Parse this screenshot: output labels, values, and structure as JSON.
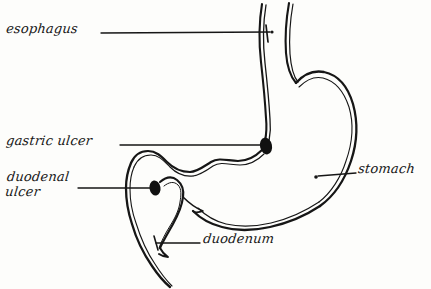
{
  "figure": {
    "kind": "hand-drawn anatomical line diagram",
    "background_color": "#fdfdfb",
    "ink_color": "#161616"
  },
  "labels": {
    "esophagus": "esophagus",
    "gastric_ulcer": "gastric ulcer",
    "duodenal_ulcer_line1": "duodenal",
    "duodenal_ulcer_line2": "ulcer",
    "duodenum": "duodenum",
    "stomach": "stomach"
  },
  "markers": [
    {
      "name": "gastric-ulcer-marker",
      "shape": "filled-oval",
      "color": "#111111",
      "cx": 266,
      "cy": 146,
      "rx": 6,
      "ry": 8
    },
    {
      "name": "duodenal-ulcer-marker",
      "shape": "filled-oval",
      "color": "#111111",
      "cx": 155,
      "cy": 188,
      "rx": 5.5,
      "ry": 7.5
    }
  ],
  "leader_lines": [
    {
      "name": "esophagus-leader",
      "from_x": 101,
      "from_y": 33,
      "to_x": 271,
      "to_y": 32,
      "end_marker": "cross-tick"
    },
    {
      "name": "gastric-ulcer-leader",
      "from_x": 120,
      "from_y": 145,
      "to_x": 261,
      "to_y": 145,
      "end_marker": "ulcer-oval"
    },
    {
      "name": "duodenal-ulcer-leader",
      "from_x": 78,
      "from_y": 188,
      "to_x": 150,
      "to_y": 188,
      "end_marker": "ulcer-oval"
    },
    {
      "name": "duodenum-leader",
      "from_x": 200,
      "from_y": 243,
      "to_x": 155,
      "to_y": 243,
      "end_marker": "cross-tick"
    },
    {
      "name": "stomach-leader",
      "from_x": 356,
      "from_y": 173,
      "to_x": 316,
      "to_y": 177,
      "end_marker": "dot"
    }
  ]
}
